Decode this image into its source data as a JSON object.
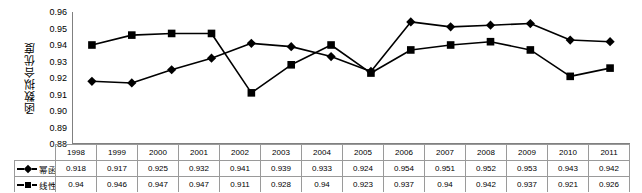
{
  "chart_data": {
    "type": "line",
    "title": "",
    "xlabel": "",
    "ylabel": "函数拟合优度",
    "ylim": [
      0.88,
      0.96
    ],
    "ytick_step": 0.01,
    "yticks": [
      "0.96",
      "0.95",
      "0.94",
      "0.93",
      "0.92",
      "0.91",
      "0.90",
      "0.89",
      "0.88"
    ],
    "grid": false,
    "legend_position": "data-table-left-column",
    "categories": [
      "1998",
      "1999",
      "2000",
      "2001",
      "2002",
      "2003",
      "2004",
      "2005",
      "2006",
      "2007",
      "2008",
      "2009",
      "2010",
      "2011"
    ],
    "series": [
      {
        "name": "幂函数",
        "marker": "diamond",
        "color": "#000000",
        "values": [
          0.918,
          0.917,
          0.925,
          0.932,
          0.941,
          0.939,
          0.933,
          0.924,
          0.954,
          0.951,
          0.952,
          0.953,
          0.943,
          0.942
        ],
        "labels": [
          "0.918",
          "0.917",
          "0.925",
          "0.932",
          "0.941",
          "0.939",
          "0.933",
          "0.924",
          "0.954",
          "0.951",
          "0.952",
          "0.953",
          "0.943",
          "0.942"
        ]
      },
      {
        "name": "线性函数",
        "marker": "square",
        "color": "#000000",
        "values": [
          0.94,
          0.946,
          0.947,
          0.947,
          0.911,
          0.928,
          0.94,
          0.923,
          0.937,
          0.94,
          0.942,
          0.937,
          0.921,
          0.926
        ],
        "labels": [
          "0.94",
          "0.946",
          "0.947",
          "0.947",
          "0.911",
          "0.928",
          "0.94",
          "0.923",
          "0.937",
          "0.94",
          "0.942",
          "0.937",
          "0.921",
          "0.926"
        ]
      }
    ]
  },
  "table": {
    "corner_label": ""
  }
}
